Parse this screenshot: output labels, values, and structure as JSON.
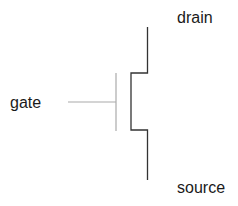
{
  "diagram": {
    "type": "mosfet-symbol",
    "labels": {
      "drain": "drain",
      "gate": "gate",
      "source": "source"
    },
    "colors": {
      "channel_line": "#333333",
      "gate_line": "#aaaaaa",
      "text": "#1a1a1a"
    }
  }
}
